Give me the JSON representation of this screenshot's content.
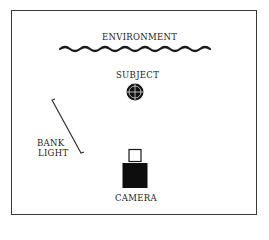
{
  "diagram": {
    "type": "lighting-setup",
    "labels": {
      "environment": "ENVIRONMENT",
      "subject": "SUBJECT",
      "bank_light_line1": "BANK",
      "bank_light_line2": "LIGHT",
      "camera": "CAMERA"
    },
    "elements": [
      {
        "id": "environment",
        "shape": "wavy-line",
        "position": "top"
      },
      {
        "id": "subject",
        "shape": "circle-crosshair",
        "position": "center"
      },
      {
        "id": "bank-light",
        "shape": "diagonal-line",
        "position": "left"
      },
      {
        "id": "camera",
        "shape": "box-with-viewfinder",
        "position": "bottom-center"
      }
    ],
    "colors": {
      "ink": "#1a1a1a",
      "background": "#ffffff"
    }
  }
}
